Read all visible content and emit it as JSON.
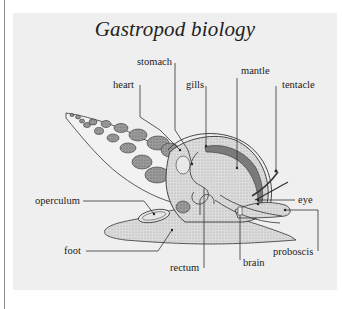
{
  "diagram": {
    "title": "Gastropod biology",
    "labels": {
      "stomach": "stomach",
      "heart": "heart",
      "gills": "gills",
      "mantle": "mantle",
      "tentacle": "tentacle",
      "operculum": "operculum",
      "eye": "eye",
      "foot": "foot",
      "proboscis": "proboscis",
      "brain": "brain",
      "rectum": "rectum"
    },
    "colors": {
      "panel": "#efefef",
      "line": "#333333",
      "shell_chamber": "#8f8f8f",
      "body_fill": "#d8d8d8",
      "mantle_band": "#7a7a7a"
    }
  }
}
